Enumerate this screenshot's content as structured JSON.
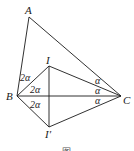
{
  "diagram": {
    "type": "geometry",
    "points": {
      "A": {
        "label": "A",
        "x": 29,
        "y": 17
      },
      "I": {
        "label": "I",
        "x": 49,
        "y": 66
      },
      "B": {
        "label": "B",
        "x": 17,
        "y": 96
      },
      "C": {
        "label": "C",
        "x": 121,
        "y": 96
      },
      "I2": {
        "label": "I′",
        "x": 49,
        "y": 127
      }
    },
    "segments": [
      [
        "A",
        "B"
      ],
      [
        "A",
        "C"
      ],
      [
        "B",
        "C"
      ],
      [
        "B",
        "I"
      ],
      [
        "I",
        "C"
      ],
      [
        "B",
        "I2"
      ],
      [
        "I2",
        "C"
      ],
      [
        "I",
        "I2"
      ]
    ],
    "angle_labels": {
      "b1": "2α",
      "b2": "2α",
      "b3": "2α",
      "c1": "α",
      "c2": "α",
      "c3": "α"
    },
    "caption": "图"
  }
}
